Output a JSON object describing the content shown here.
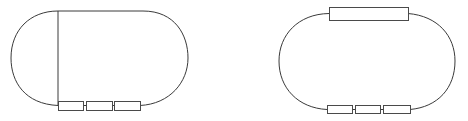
{
  "diagram": {
    "type": "circuit-loops",
    "stroke_color": "#3a3a3a",
    "background": "#ffffff",
    "figures": [
      {
        "id": "left-loop",
        "description": "Closed oval loop with three small series components on the bottom segment",
        "loop": {
          "top_y": 11,
          "bottom_y": 105,
          "left_x": 11,
          "right_x": 188,
          "straight_start_x": 58,
          "straight_end_x": 143
        },
        "components": [
          {
            "label": "",
            "x": 58,
            "y": 101,
            "w": 25,
            "h": 9,
            "position": "bottom"
          },
          {
            "label": "",
            "x": 86,
            "y": 101,
            "w": 26,
            "h": 9,
            "position": "bottom"
          },
          {
            "label": "",
            "x": 114,
            "y": 101,
            "w": 26,
            "h": 9,
            "position": "bottom"
          }
        ]
      },
      {
        "id": "right-loop",
        "description": "Closed oval loop with one large component on top segment and three small series components on bottom segment",
        "loop": {
          "top_y": 13,
          "bottom_y": 109,
          "left_x": 279,
          "right_x": 455
        },
        "components": [
          {
            "label": "",
            "x": 329,
            "y": 7,
            "w": 79,
            "h": 13,
            "position": "top"
          },
          {
            "label": "",
            "x": 327,
            "y": 105,
            "w": 25,
            "h": 9,
            "position": "bottom"
          },
          {
            "label": "",
            "x": 355,
            "y": 105,
            "w": 25,
            "h": 9,
            "position": "bottom"
          },
          {
            "label": "",
            "x": 383,
            "y": 105,
            "w": 27,
            "h": 9,
            "position": "bottom"
          }
        ]
      }
    ]
  }
}
